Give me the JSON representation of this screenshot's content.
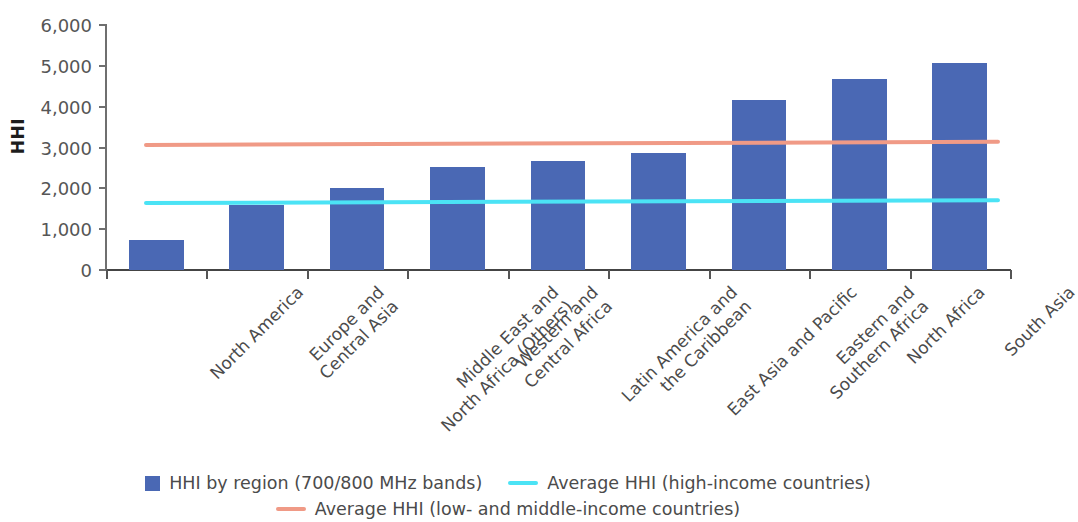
{
  "chart_data": {
    "type": "bar",
    "title": "",
    "xlabel": "",
    "ylabel": "HHI",
    "ylim": [
      0,
      6000
    ],
    "ytick_labels": [
      "0",
      "1,000",
      "2,000",
      "3,000",
      "4,000",
      "5,000",
      "6,000"
    ],
    "ytick_values": [
      0,
      1000,
      2000,
      3000,
      4000,
      5000,
      6000
    ],
    "grid": false,
    "legend_position": "bottom",
    "categories": [
      "North America",
      "Europe and\nCentral Asia",
      "Middle East and\nNorth Africa (Others)",
      "Western and\nCentral Africa",
      "Latin America and\nthe Caribbean",
      "East Asia and Pacific",
      "Eastern and\nSouthern Africa",
      "North Africa",
      "South Asia"
    ],
    "series": [
      {
        "name": "HHI by region (700/800 MHz bands)",
        "type": "bar",
        "color": "#4a68b4",
        "values": [
          730,
          1600,
          2010,
          2520,
          2670,
          2860,
          4170,
          4680,
          5060
        ]
      },
      {
        "name": "Average HHI (high-income countries)",
        "type": "hline",
        "color": "#4be3f5",
        "value": 1650,
        "value_start": 1630,
        "value_end": 1700
      },
      {
        "name": "Average HHI (low- and middle-income countries)",
        "type": "hline",
        "color": "#f09a86",
        "value": 3090,
        "value_start": 3070,
        "value_end": 3150
      }
    ]
  },
  "axis": {
    "y_title": "HHI",
    "ticks": [
      {
        "label": "6,000",
        "value": 6000
      },
      {
        "label": "5,000",
        "value": 5000
      },
      {
        "label": "4,000",
        "value": 4000
      },
      {
        "label": "3,000",
        "value": 3000
      },
      {
        "label": "2,000",
        "value": 2000
      },
      {
        "label": "1,000",
        "value": 1000
      },
      {
        "label": "0",
        "value": 0
      }
    ]
  },
  "categories": [
    {
      "line1": "North America",
      "line2": ""
    },
    {
      "line1": "Europe and",
      "line2": "Central Asia"
    },
    {
      "line1": "Middle East and",
      "line2": "North Africa (Others)"
    },
    {
      "line1": "Western and",
      "line2": "Central Africa"
    },
    {
      "line1": "Latin America and",
      "line2": "the Caribbean"
    },
    {
      "line1": "East Asia and Pacific",
      "line2": ""
    },
    {
      "line1": "Eastern and",
      "line2": "Southern Africa"
    },
    {
      "line1": "North Africa",
      "line2": ""
    },
    {
      "line1": "South Asia",
      "line2": ""
    }
  ],
  "legend": {
    "bars": "HHI by region (700/800 MHz bands)",
    "high_income": "Average HHI (high-income countries)",
    "low_middle_income": "Average HHI (low- and middle-income countries)"
  },
  "colors": {
    "bar": "#4a68b4",
    "high_income_line": "#4be3f5",
    "low_middle_income_line": "#f09a86",
    "axis": "#555555",
    "text": "#4b4b4b"
  }
}
